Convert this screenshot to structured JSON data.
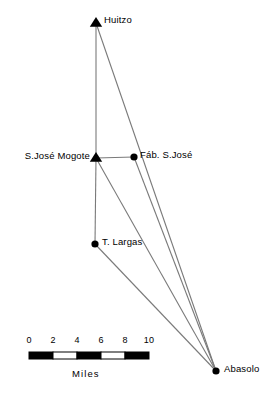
{
  "figure": {
    "type": "site-location-map",
    "background_color": "#ffffff",
    "foreground_color": "#000000",
    "link_color": "#7a7a7a"
  },
  "sites": [
    {
      "id": "huitzo",
      "label": "Huitzo",
      "marker": "triangle",
      "x": 96,
      "y": 23,
      "label_x": 104,
      "label_y": 15,
      "label_align": "left"
    },
    {
      "id": "s-jose-mogote",
      "label": "S.José  Mogote",
      "marker": "triangle",
      "x": 96,
      "y": 158,
      "label_x": 90,
      "label_y": 151,
      "label_align": "right"
    },
    {
      "id": "fab-s-jose",
      "label": "Fáb. S.José",
      "marker": "circle",
      "x": 134,
      "y": 157,
      "label_x": 140,
      "label_y": 150,
      "label_align": "left"
    },
    {
      "id": "t-largas",
      "label": "T. Largas",
      "marker": "circle",
      "x": 95,
      "y": 244,
      "label_x": 102,
      "label_y": 237,
      "label_align": "left"
    },
    {
      "id": "abasolo",
      "label": "Abasolo",
      "marker": "circle",
      "x": 216,
      "y": 371,
      "label_x": 224,
      "label_y": 364,
      "label_align": "left"
    }
  ],
  "links": [
    {
      "from": "huitzo",
      "to": "s-jose-mogote"
    },
    {
      "from": "huitzo",
      "to": "abasolo"
    },
    {
      "from": "s-jose-mogote",
      "to": "fab-s-jose"
    },
    {
      "from": "s-jose-mogote",
      "to": "t-largas"
    },
    {
      "from": "s-jose-mogote",
      "to": "abasolo"
    },
    {
      "from": "fab-s-jose",
      "to": "abasolo"
    },
    {
      "from": "t-largas",
      "to": "abasolo"
    }
  ],
  "scale_bar": {
    "units_label": "Miles",
    "units_label_x": 72,
    "units_label_y": 369,
    "tick_labels": [
      "0",
      "2",
      "4",
      "6",
      "8",
      "10"
    ],
    "min": 0,
    "max": 10,
    "step": 2,
    "bar_left": 29,
    "bar_right": 149,
    "bar_top": 352,
    "bar_height": 7,
    "label_y": 336,
    "segments": [
      {
        "from": 0,
        "to": 2,
        "filled": true
      },
      {
        "from": 2,
        "to": 4,
        "filled": false
      },
      {
        "from": 4,
        "to": 6,
        "filled": true
      },
      {
        "from": 6,
        "to": 8,
        "filled": false
      },
      {
        "from": 8,
        "to": 10,
        "filled": true
      }
    ]
  }
}
